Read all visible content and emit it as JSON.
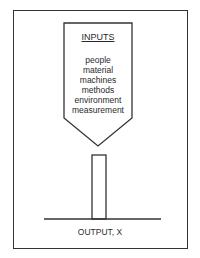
{
  "diagram": {
    "inputs_title": "INPUTS",
    "inputs": [
      "people",
      "material",
      "machines",
      "methods",
      "environment",
      "measurement"
    ],
    "output_label": "OUTPUT, X"
  }
}
